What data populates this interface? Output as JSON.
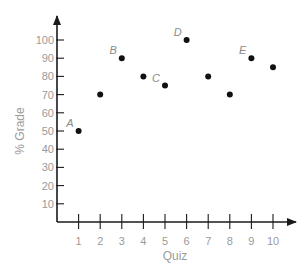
{
  "chart_data": {
    "type": "scatter",
    "title": "",
    "xlabel": "Quiz",
    "ylabel": "% Grade",
    "x": [
      1,
      2,
      3,
      4,
      5,
      6,
      7,
      8,
      9,
      10
    ],
    "values": [
      50,
      70,
      90,
      80,
      75,
      100,
      80,
      70,
      90,
      85
    ],
    "point_labels": [
      "A",
      "",
      "B",
      "",
      "C",
      "D",
      "",
      "",
      "E",
      ""
    ],
    "x_ticks": [
      "1",
      "2",
      "3",
      "4",
      "5",
      "6",
      "7",
      "8",
      "9",
      "10"
    ],
    "y_ticks": [
      "10",
      "20",
      "30",
      "40",
      "50",
      "60",
      "70",
      "80",
      "90",
      "100"
    ],
    "xlim": [
      0,
      11
    ],
    "ylim": [
      0,
      105
    ],
    "grid": false,
    "legend": null,
    "colors": {
      "axis": "#1a1a1a",
      "points": "#111111",
      "text": "#9a9a9a"
    }
  }
}
